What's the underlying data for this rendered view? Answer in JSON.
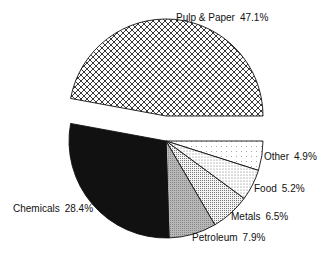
{
  "chart_data": {
    "type": "pie",
    "title": "",
    "start_angle_deg": 0,
    "direction": "clockwise",
    "slices": [
      {
        "label": "Other",
        "value": 4.9,
        "pct_label": "4.9%",
        "pattern": "sparse-dots",
        "exploded": false
      },
      {
        "label": "Food",
        "value": 5.2,
        "pct_label": "5.2%",
        "pattern": "dots",
        "exploded": false
      },
      {
        "label": "Metals",
        "value": 6.5,
        "pct_label": "6.5%",
        "pattern": "fine-stipple",
        "exploded": false
      },
      {
        "label": "Petroleum",
        "value": 7.9,
        "pct_label": "7.9%",
        "pattern": "gray",
        "exploded": false
      },
      {
        "label": "Chemicals",
        "value": 28.4,
        "pct_label": "28.4%",
        "pattern": "black",
        "exploded": false
      },
      {
        "label": "Pulp & Paper",
        "value": 47.1,
        "pct_label": "47.1%",
        "pattern": "crosshatch",
        "exploded": true
      }
    ],
    "legend": "none (labels beside slices)"
  },
  "labels": {
    "pulp": {
      "name": "Pulp & Paper",
      "pct": "47.1%"
    },
    "chemicals": {
      "name": "Chemicals",
      "pct": "28.4%"
    },
    "petroleum": {
      "name": "Petroleum",
      "pct": "7.9%"
    },
    "metals": {
      "name": "Metals",
      "pct": "6.5%"
    },
    "food": {
      "name": "Food",
      "pct": "5.2%"
    },
    "other": {
      "name": "Other",
      "pct": "4.9%"
    }
  }
}
